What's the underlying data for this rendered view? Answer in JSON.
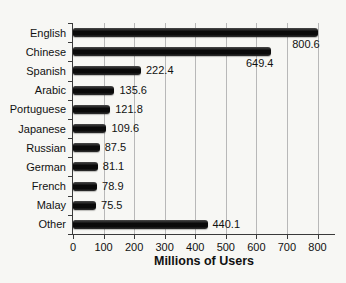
{
  "page": {
    "background": "#f7f7f4"
  },
  "chart_data": {
    "type": "bar",
    "orientation": "horizontal",
    "title": "",
    "xlabel": "Millions of Users",
    "ylabel": "",
    "categories": [
      "English",
      "Chinese",
      "Spanish",
      "Arabic",
      "Portuguese",
      "Japanese",
      "Russian",
      "German",
      "French",
      "Malay",
      "Other"
    ],
    "values": [
      800.6,
      649.4,
      222.4,
      135.6,
      121.8,
      109.6,
      87.5,
      81.1,
      78.9,
      75.5,
      440.1
    ],
    "value_labels": [
      "800.6",
      "649.4",
      "222.4",
      "135.6",
      "121.8",
      "109.6",
      "87.5",
      "81.1",
      "78.9",
      "75.5",
      "440.1"
    ],
    "value_label_placement": [
      "below",
      "below",
      "right",
      "right",
      "right",
      "right",
      "right",
      "right",
      "right",
      "right",
      "right"
    ],
    "xlim": [
      0,
      800
    ],
    "xticks": [
      0,
      100,
      200,
      300,
      400,
      500,
      600,
      700,
      800
    ],
    "grid": "vertical",
    "legend": "none",
    "bar_color": "#0a0a0a",
    "bar_highlight_color": "#4a4a4a",
    "gridline_color": "#b8b8b8",
    "axis_color": "#3a3a3a",
    "text_color": "#111111"
  }
}
